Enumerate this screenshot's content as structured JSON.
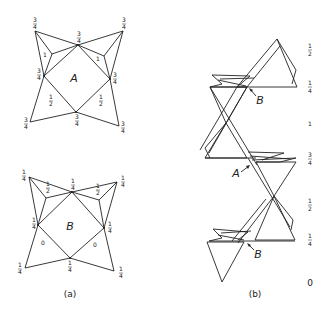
{
  "figure": {
    "panel_a": {
      "caption": "(a)",
      "layer_A": {
        "label": "A",
        "vertex_heights": {
          "top_left": [
            "3",
            "4"
          ],
          "top_mid": [
            "3",
            "4"
          ],
          "top_right": [
            "3",
            "4"
          ],
          "left": [
            "3",
            "4"
          ],
          "right": [
            "3",
            "4"
          ],
          "bottom_mid": [
            "3",
            "4"
          ],
          "bottom_left": [
            "3",
            "4"
          ],
          "bottom_right": [
            "3",
            "4"
          ]
        },
        "face_heights": {
          "upper_left": "1",
          "upper_right": "1",
          "lower_left": [
            "1",
            "2"
          ],
          "lower_right": [
            "1",
            "2"
          ]
        }
      },
      "layer_B": {
        "label": "B",
        "vertex_heights": {
          "top_left": [
            "1",
            "4"
          ],
          "top_mid": [
            "1",
            "4"
          ],
          "top_right": [
            "1",
            "4"
          ],
          "left": [
            "1",
            "4"
          ],
          "right": [
            "1",
            "4"
          ],
          "bottom_mid": [
            "1",
            "4"
          ],
          "bottom_left": [
            "1",
            "4"
          ],
          "bottom_right": [
            "1",
            "4"
          ]
        },
        "face_heights": {
          "upper_left": [
            "1",
            "2"
          ],
          "upper_right": [
            "1",
            "2"
          ],
          "lower_left": "0",
          "lower_right": "0"
        }
      }
    },
    "panel_b": {
      "caption": "(b)",
      "pointer_labels": [
        "B",
        "A",
        "B"
      ],
      "height_axis": [
        [
          "1",
          "2"
        ],
        [
          "1",
          "4"
        ],
        "1",
        [
          "3",
          "4"
        ],
        [
          "1",
          "2"
        ],
        [
          "1",
          "4"
        ],
        "0"
      ]
    }
  }
}
